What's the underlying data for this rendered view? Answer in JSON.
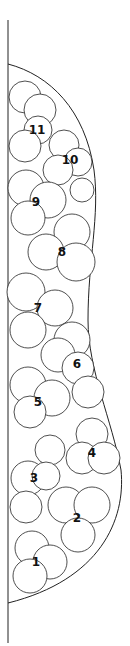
{
  "diagram": {
    "type": "lobed-cluster-stack",
    "region_count": 11,
    "regions": [
      {
        "id": "1",
        "label": "1",
        "x": 36,
        "y": 562
      },
      {
        "id": "2",
        "label": "2",
        "x": 77,
        "y": 518
      },
      {
        "id": "3",
        "label": "3",
        "x": 34,
        "y": 478
      },
      {
        "id": "4",
        "label": "4",
        "x": 92,
        "y": 453
      },
      {
        "id": "5",
        "label": "5",
        "x": 38,
        "y": 402
      },
      {
        "id": "6",
        "label": "6",
        "x": 77,
        "y": 364
      },
      {
        "id": "7",
        "label": "7",
        "x": 38,
        "y": 308
      },
      {
        "id": "8",
        "label": "8",
        "x": 62,
        "y": 252
      },
      {
        "id": "9",
        "label": "9",
        "x": 36,
        "y": 202
      },
      {
        "id": "10",
        "label": "10",
        "x": 70,
        "y": 160
      },
      {
        "id": "11",
        "label": "11",
        "x": 37,
        "y": 130
      }
    ],
    "colors": {
      "stroke": "#222222",
      "fill": "#ffffff",
      "text": "#111111"
    }
  }
}
